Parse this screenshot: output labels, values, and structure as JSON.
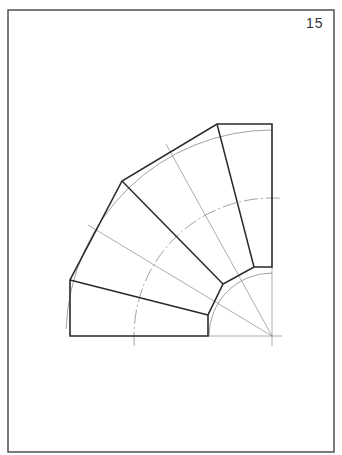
{
  "page": {
    "number": "15",
    "frame": {
      "x": 8,
      "y": 10,
      "w": 326,
      "h": 442,
      "stroke": "#444444"
    }
  },
  "drawing": {
    "title": "Segmented 90° pipe bend (four segments) — template development",
    "center": [
      272,
      336
    ],
    "colors": {
      "outline": "#2a2a2a",
      "construction": "#8a8a8a"
    },
    "outline_polygon": [
      [
        70,
        336
      ],
      [
        70,
        280
      ],
      [
        122,
        181
      ],
      [
        217,
        124
      ],
      [
        272,
        124
      ],
      [
        272,
        267
      ],
      [
        254,
        267
      ],
      [
        223,
        284
      ],
      [
        208,
        315
      ],
      [
        208,
        336
      ]
    ],
    "segment_dividers": [
      [
        [
          70,
          280
        ],
        [
          208,
          315
        ]
      ],
      [
        [
          122,
          181
        ],
        [
          223,
          284
        ]
      ],
      [
        [
          217,
          124
        ],
        [
          254,
          267
        ]
      ]
    ],
    "construction_lines": [
      [
        [
          88,
          225
        ],
        [
          272,
          336
        ]
      ],
      [
        [
          166,
          144
        ],
        [
          272,
          336
        ]
      ],
      [
        [
          208,
          336
        ],
        [
          282,
          336
        ]
      ],
      [
        [
          272,
          267
        ],
        [
          272,
          346
        ]
      ]
    ],
    "arcs": [
      {
        "name": "outer-arc",
        "r": 206,
        "from_deg": 178,
        "to_deg": 90,
        "dash": ""
      },
      {
        "name": "center-arc",
        "r": 138,
        "from_deg": 184,
        "to_deg": 86,
        "dash": "14 3 2 3"
      },
      {
        "name": "inner-arc",
        "r": 63,
        "from_deg": 180,
        "to_deg": 90,
        "dash": ""
      }
    ]
  }
}
